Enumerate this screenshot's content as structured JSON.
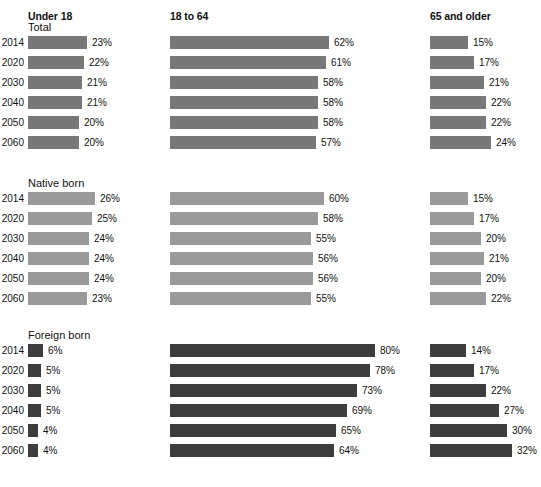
{
  "chart_data": {
    "type": "bar",
    "title": "",
    "subtitle": "",
    "xlabel": "",
    "ylabel": "",
    "orientation": "horizontal",
    "grid": false,
    "legend_position": "none",
    "value_suffix": "%",
    "xlim": [
      0,
      100
    ],
    "categories": [
      "2014",
      "2020",
      "2030",
      "2040",
      "2050",
      "2060"
    ],
    "column_headers": [
      "Under 18",
      "18 to 64",
      "65 and older"
    ],
    "panels": [
      {
        "label": "Total",
        "series": [
          {
            "name": "Under 18",
            "values": [
              23,
              22,
              21,
              21,
              20,
              20
            ],
            "labels": [
              "23%",
              "22%",
              "21%",
              "21%",
              "20%",
              "20%"
            ]
          },
          {
            "name": "18 to 64",
            "values": [
              62,
              61,
              58,
              58,
              58,
              57
            ],
            "labels": [
              "62%",
              "61%",
              "58%",
              "58%",
              "58%",
              "57%"
            ]
          },
          {
            "name": "65 and older",
            "values": [
              15,
              17,
              21,
              22,
              22,
              24
            ],
            "labels": [
              "15%",
              "17%",
              "21%",
              "22%",
              "22%",
              "24%"
            ]
          }
        ]
      },
      {
        "label": "Native born",
        "series": [
          {
            "name": "Under 18",
            "values": [
              26,
              25,
              24,
              24,
              24,
              23
            ],
            "labels": [
              "26%",
              "25%",
              "24%",
              "24%",
              "24%",
              "23%"
            ]
          },
          {
            "name": "18 to 64",
            "values": [
              60,
              58,
              55,
              56,
              56,
              55
            ],
            "labels": [
              "60%",
              "58%",
              "55%",
              "56%",
              "56%",
              "55%"
            ]
          },
          {
            "name": "65 and older",
            "values": [
              15,
              17,
              20,
              21,
              20,
              22
            ],
            "labels": [
              "15%",
              "17%",
              "20%",
              "21%",
              "20%",
              "22%"
            ]
          }
        ]
      },
      {
        "label": "Foreign born",
        "series": [
          {
            "name": "Under 18",
            "values": [
              6,
              5,
              5,
              5,
              4,
              4
            ],
            "labels": [
              "6%",
              "5%",
              "5%",
              "5%",
              "4%",
              "4%"
            ]
          },
          {
            "name": "18 to 64",
            "values": [
              80,
              78,
              73,
              69,
              65,
              64
            ],
            "labels": [
              "80%",
              "78%",
              "73%",
              "69%",
              "65%",
              "64%"
            ]
          },
          {
            "name": "65 and older",
            "values": [
              14,
              17,
              22,
              27,
              30,
              32
            ],
            "labels": [
              "14%",
              "17%",
              "22%",
              "27%",
              "30%",
              "32%"
            ]
          }
        ]
      }
    ],
    "colors": {
      "total": "#787878",
      "native": "#9a9a9a",
      "foreign": "#3d3d3d",
      "text": "#111111",
      "background": "#ffffff"
    }
  },
  "layout": {
    "column_x": [
      28,
      170,
      430
    ],
    "px_per_percent": 2.56,
    "panel_top": [
      36,
      192,
      344
    ],
    "row_pitch": 20,
    "bar_height": 13,
    "header_y": 10,
    "group_label_dy": -15
  }
}
